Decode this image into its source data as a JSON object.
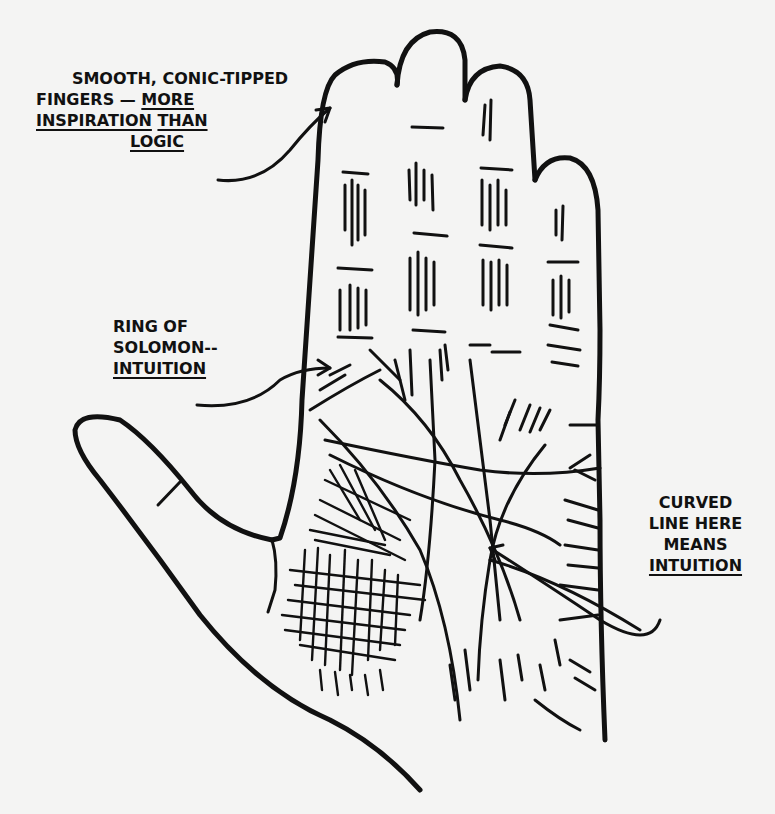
{
  "diagram": {
    "annotations": [
      {
        "id": "fingers",
        "lines": [
          {
            "parts": [
              {
                "text": "SMOOTH, CONIC-TIPPED",
                "underline": false
              }
            ]
          },
          {
            "parts": [
              {
                "text": "FINGERS — ",
                "underline": false
              },
              {
                "text": "MORE",
                "underline": true
              }
            ]
          },
          {
            "parts": [
              {
                "text": "INSPIRATION",
                "underline": true
              },
              {
                "text": " ",
                "underline": false
              },
              {
                "text": "THAN",
                "underline": true
              }
            ]
          },
          {
            "parts": [
              {
                "text": "LOGIC",
                "underline": true
              }
            ]
          }
        ],
        "points_to": "index finger"
      },
      {
        "id": "ring-of-solomon",
        "lines": [
          {
            "parts": [
              {
                "text": "RING OF",
                "underline": false
              }
            ]
          },
          {
            "parts": [
              {
                "text": "SOLOMON--",
                "underline": false
              }
            ]
          },
          {
            "parts": [
              {
                "text": "INTUITION",
                "underline": true
              }
            ]
          }
        ],
        "points_to": "base of index finger"
      },
      {
        "id": "curved-line",
        "lines": [
          {
            "parts": [
              {
                "text": "CURVED",
                "underline": false
              }
            ]
          },
          {
            "parts": [
              {
                "text": "LINE HERE",
                "underline": false
              }
            ]
          },
          {
            "parts": [
              {
                "text": "MEANS",
                "underline": false
              }
            ]
          },
          {
            "parts": [
              {
                "text": "INTUITION",
                "underline": true
              }
            ]
          }
        ],
        "points_to": "curved line on lower palm"
      }
    ]
  },
  "text": {
    "fingers_l1": "SMOOTH, CONIC-TIPPED",
    "fingers_l2a": "FINGERS — ",
    "fingers_l2b": "MORE",
    "fingers_l3a": "INSPIRATION",
    "fingers_l3b": "THAN",
    "fingers_l4": "LOGIC",
    "ring_l1": "RING OF",
    "ring_l2": "SOLOMON--",
    "ring_l3": "INTUITION",
    "curved_l1": "CURVED",
    "curved_l2": "LINE HERE",
    "curved_l3": "MEANS",
    "curved_l4": "INTUITION"
  },
  "colors": {
    "ink": "#111111",
    "paper": "#f4f4f3"
  }
}
